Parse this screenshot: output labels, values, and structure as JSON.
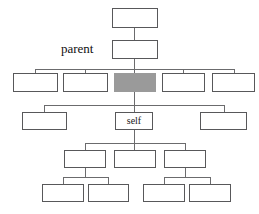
{
  "diagram": {
    "type": "tree-hierarchy-diagram",
    "title": "",
    "background_color": "#ffffff",
    "box_fill": "#ffffff",
    "box_stroke": "#58585a",
    "highlight_fill": "#9a9a9a",
    "edge_color": "#6b6b6d",
    "captions": [
      {
        "id": "caption-parent",
        "text": "parent",
        "x": 61,
        "y": 42,
        "font_size": 13
      }
    ],
    "nodes": [
      {
        "id": "node-root",
        "label": "",
        "x": 112,
        "y": 8,
        "w": 46,
        "h": 20,
        "highlight": false
      },
      {
        "id": "node-parent",
        "label": "",
        "x": 112,
        "y": 40,
        "w": 46,
        "h": 19,
        "highlight": false
      },
      {
        "id": "node-sibling-1",
        "label": "",
        "x": 13,
        "y": 73,
        "w": 45,
        "h": 19,
        "highlight": false
      },
      {
        "id": "node-sibling-2",
        "label": "",
        "x": 63,
        "y": 73,
        "w": 45,
        "h": 19,
        "highlight": false
      },
      {
        "id": "node-current",
        "label": "",
        "x": 114,
        "y": 73,
        "w": 42,
        "h": 19,
        "highlight": true
      },
      {
        "id": "node-sibling-3",
        "label": "",
        "x": 162,
        "y": 73,
        "w": 43,
        "h": 19,
        "highlight": false
      },
      {
        "id": "node-sibling-4",
        "label": "",
        "x": 212,
        "y": 73,
        "w": 43,
        "h": 19,
        "highlight": false
      },
      {
        "id": "node-child-left",
        "label": "",
        "x": 22,
        "y": 112,
        "w": 45,
        "h": 18,
        "highlight": false
      },
      {
        "id": "node-self",
        "label": "self",
        "x": 115,
        "y": 112,
        "w": 38,
        "h": 18,
        "highlight": false
      },
      {
        "id": "node-child-right",
        "label": "",
        "x": 200,
        "y": 112,
        "w": 47,
        "h": 18,
        "highlight": false
      },
      {
        "id": "node-gc-1",
        "label": "",
        "x": 64,
        "y": 150,
        "w": 42,
        "h": 18,
        "highlight": false
      },
      {
        "id": "node-gc-2",
        "label": "",
        "x": 114,
        "y": 150,
        "w": 42,
        "h": 18,
        "highlight": false
      },
      {
        "id": "node-gc-3",
        "label": "",
        "x": 164,
        "y": 150,
        "w": 42,
        "h": 18,
        "highlight": false
      },
      {
        "id": "node-ggc-1",
        "label": "",
        "x": 42,
        "y": 184,
        "w": 42,
        "h": 18,
        "highlight": false
      },
      {
        "id": "node-ggc-2",
        "label": "",
        "x": 88,
        "y": 184,
        "w": 41,
        "h": 18,
        "highlight": false
      },
      {
        "id": "node-ggc-3",
        "label": "",
        "x": 143,
        "y": 184,
        "w": 42,
        "h": 18,
        "highlight": false
      },
      {
        "id": "node-ggc-4",
        "label": "",
        "x": 189,
        "y": 184,
        "w": 42,
        "h": 18,
        "highlight": false
      }
    ],
    "edges": [
      {
        "id": "edge-root-to-parent",
        "orient": "v",
        "x": 134,
        "y": 28,
        "len": 12
      },
      {
        "id": "edge-parent-down-to-bus",
        "orient": "v",
        "x": 134,
        "y": 59,
        "len": 14
      },
      {
        "id": "edge-sibling-bus",
        "orient": "h",
        "x": 35,
        "y": 69,
        "len": 199
      },
      {
        "id": "edge-bus-to-sibling-1",
        "orient": "v",
        "x": 35,
        "y": 69,
        "len": 4
      },
      {
        "id": "edge-bus-to-sibling-2",
        "orient": "v",
        "x": 85,
        "y": 69,
        "len": 4
      },
      {
        "id": "edge-bus-to-sibling-3",
        "orient": "v",
        "x": 183,
        "y": 69,
        "len": 4
      },
      {
        "id": "edge-bus-to-sibling-4",
        "orient": "v",
        "x": 234,
        "y": 69,
        "len": 4
      },
      {
        "id": "edge-current-down",
        "orient": "v",
        "x": 134,
        "y": 92,
        "len": 20
      },
      {
        "id": "edge-children-bus",
        "orient": "h",
        "x": 44,
        "y": 105,
        "len": 180
      },
      {
        "id": "edge-bus-to-child-left",
        "orient": "v",
        "x": 44,
        "y": 105,
        "len": 7
      },
      {
        "id": "edge-bus-to-child-right",
        "orient": "v",
        "x": 224,
        "y": 105,
        "len": 7
      },
      {
        "id": "edge-self-down",
        "orient": "v",
        "x": 134,
        "y": 130,
        "len": 14
      },
      {
        "id": "edge-gc-bus",
        "orient": "h",
        "x": 85,
        "y": 143,
        "len": 101
      },
      {
        "id": "edge-bus-to-gc-1",
        "orient": "v",
        "x": 85,
        "y": 143,
        "len": 7
      },
      {
        "id": "edge-bus-to-gc-2",
        "orient": "v",
        "x": 134,
        "y": 143,
        "len": 7
      },
      {
        "id": "edge-bus-to-gc-3",
        "orient": "v",
        "x": 185,
        "y": 143,
        "len": 7
      },
      {
        "id": "edge-gc1-down",
        "orient": "v",
        "x": 85,
        "y": 168,
        "len": 10
      },
      {
        "id": "edge-ggc-left-bus",
        "orient": "h",
        "x": 63,
        "y": 177,
        "len": 45
      },
      {
        "id": "edge-bus-to-ggc-1",
        "orient": "v",
        "x": 63,
        "y": 177,
        "len": 8
      },
      {
        "id": "edge-bus-to-ggc-2",
        "orient": "v",
        "x": 108,
        "y": 177,
        "len": 8
      },
      {
        "id": "edge-gc3-down",
        "orient": "v",
        "x": 185,
        "y": 168,
        "len": 10
      },
      {
        "id": "edge-ggc-right-bus",
        "orient": "h",
        "x": 164,
        "y": 177,
        "len": 46
      },
      {
        "id": "edge-bus-to-ggc-3",
        "orient": "v",
        "x": 164,
        "y": 177,
        "len": 8
      },
      {
        "id": "edge-bus-to-ggc-4",
        "orient": "v",
        "x": 210,
        "y": 177,
        "len": 8
      }
    ]
  }
}
